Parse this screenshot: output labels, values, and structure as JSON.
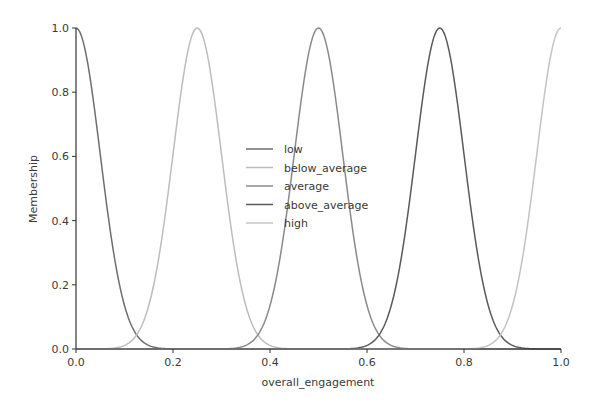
{
  "chart_data": {
    "type": "line",
    "title": "",
    "xlabel": "overall_engagement",
    "ylabel": "Membership",
    "xlim": [
      0.0,
      1.0
    ],
    "ylim": [
      0.0,
      1.0
    ],
    "xticks": [
      "0.0",
      "0.2",
      "0.4",
      "0.6",
      "0.8",
      "1.0"
    ],
    "yticks": [
      "0.0",
      "0.2",
      "0.4",
      "0.6",
      "0.8",
      "1.0"
    ],
    "grid": false,
    "legend_position": "center",
    "function": "gaussian",
    "series": [
      {
        "name": "low",
        "mean": 0.0,
        "sigma": 0.05,
        "color": "#6e6e6e"
      },
      {
        "name": "below_average",
        "mean": 0.25,
        "sigma": 0.05,
        "color": "#bdbdbd"
      },
      {
        "name": "average",
        "mean": 0.5,
        "sigma": 0.05,
        "color": "#8a8a8a"
      },
      {
        "name": "above_average",
        "mean": 0.75,
        "sigma": 0.05,
        "color": "#5a5a5a"
      },
      {
        "name": "high",
        "mean": 1.0,
        "sigma": 0.05,
        "color": "#c4c4c4"
      }
    ]
  }
}
